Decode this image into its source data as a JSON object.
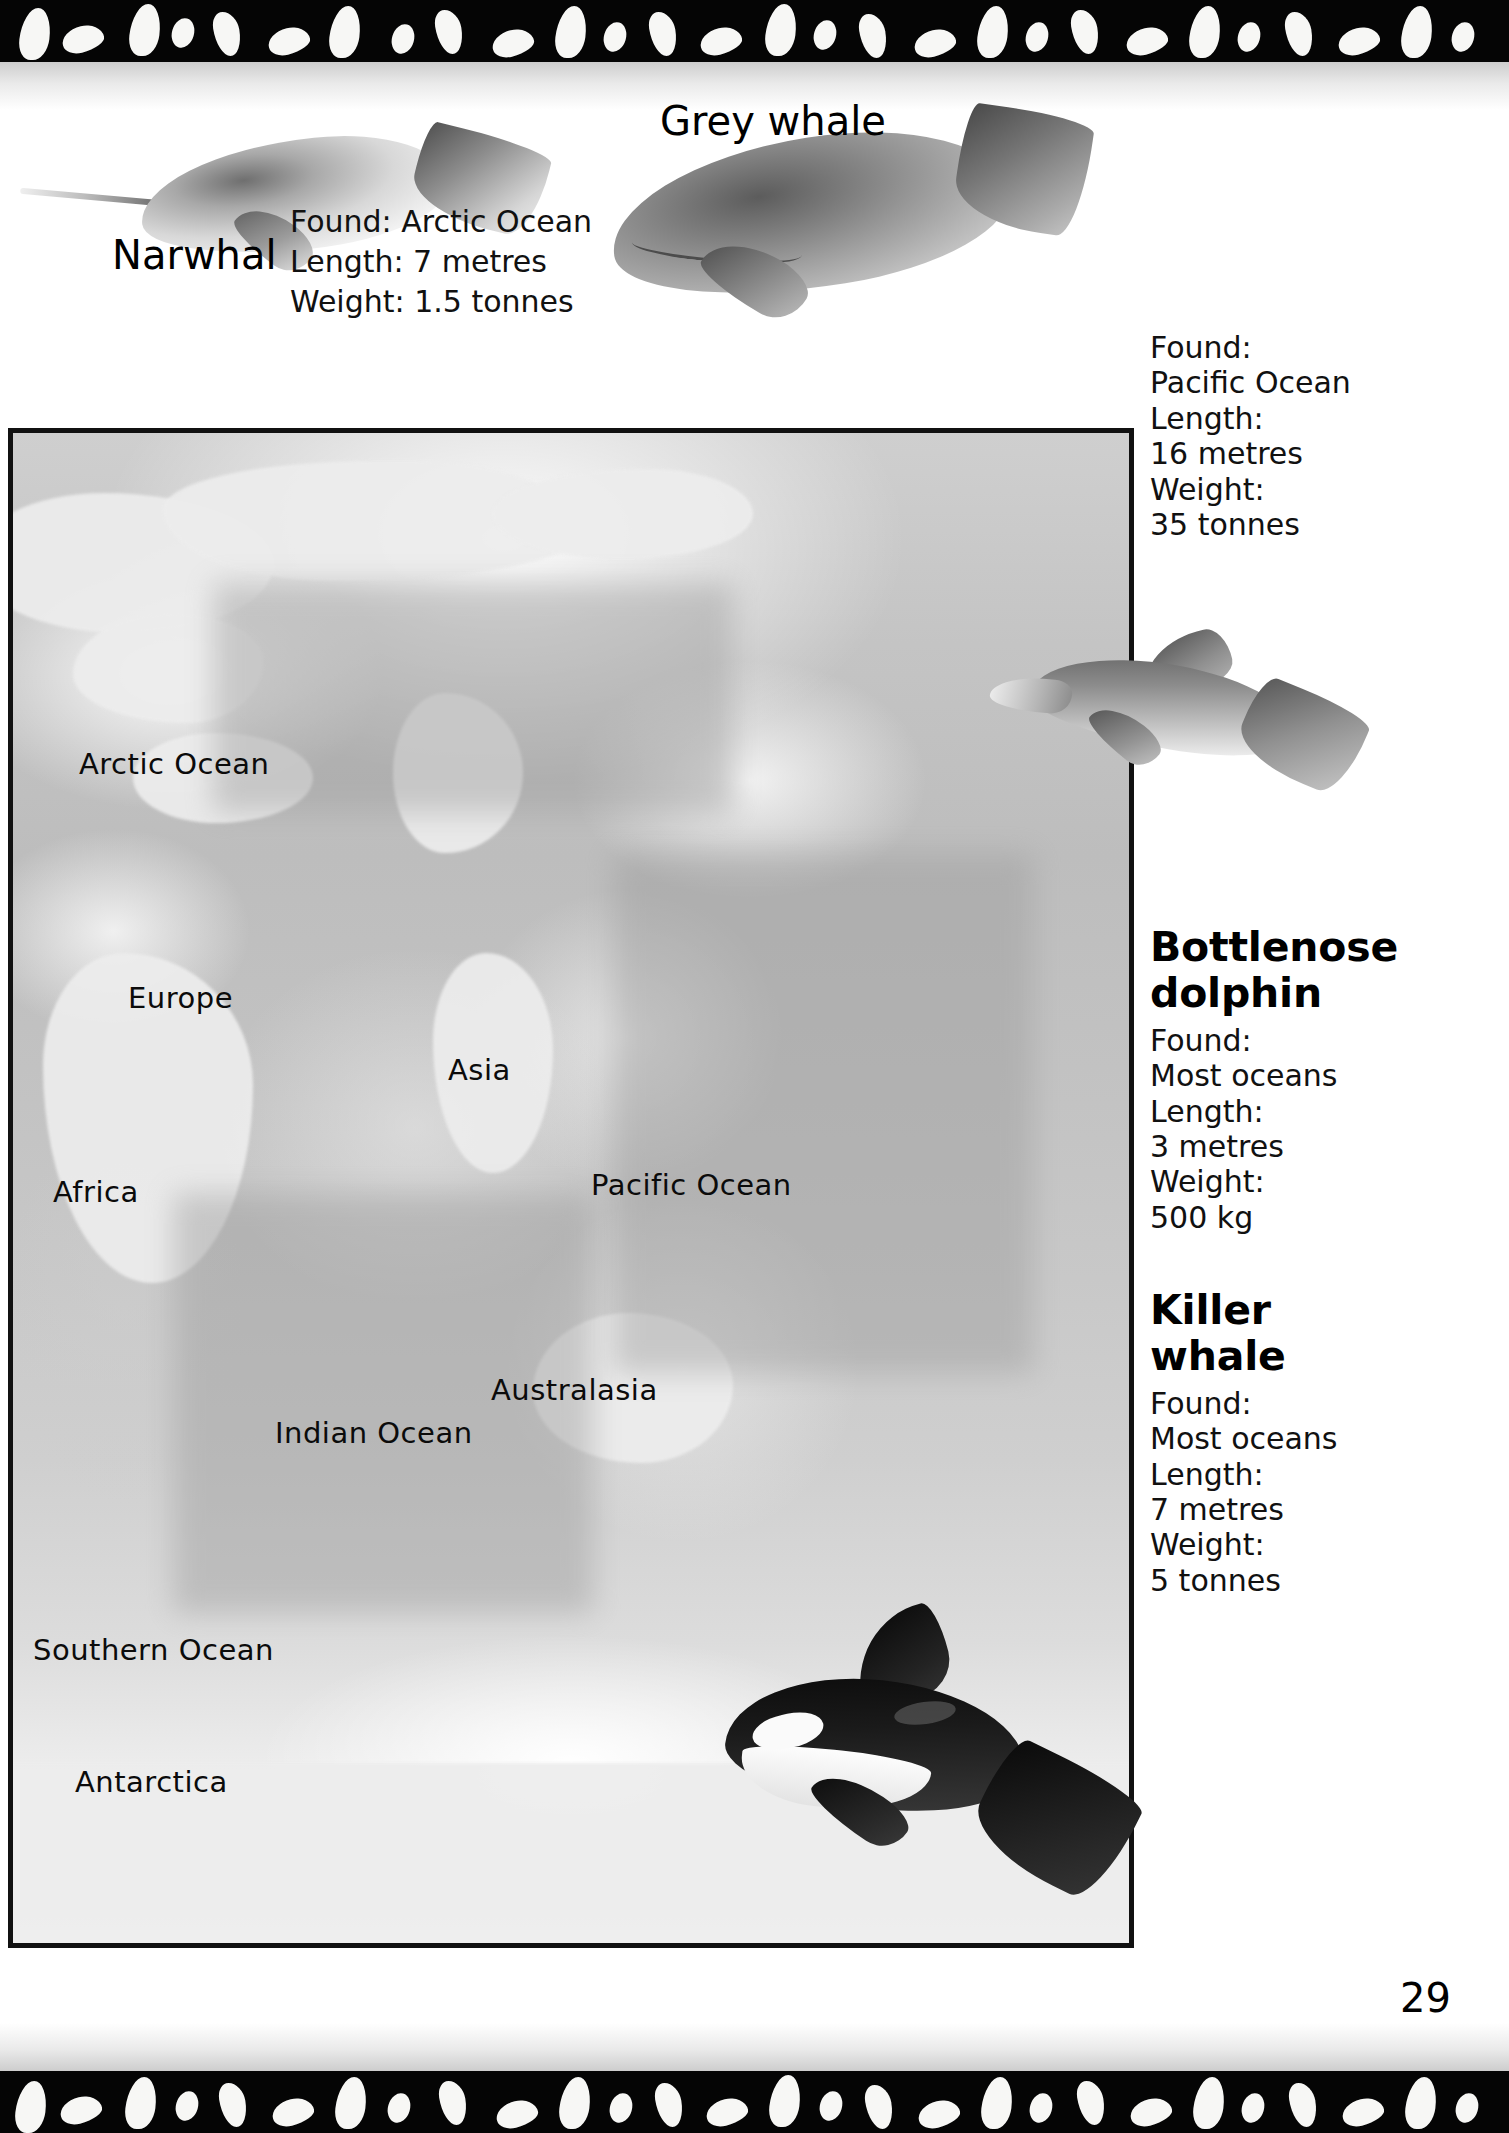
{
  "page": {
    "number": "29",
    "background_color": "#ffffff",
    "border_color": "#050505"
  },
  "specimens": [
    {
      "id": "narwhal",
      "name": "Narwhal",
      "lines": [
        "Found: Arctic Ocean",
        "Length: 7 metres",
        "Weight: 1.5 tonnes"
      ],
      "found": "Arctic Ocean",
      "length": "7 metres",
      "weight": "1.5 tonnes"
    },
    {
      "id": "grey-whale",
      "name": "Grey whale",
      "lines": [
        "Found:",
        "Pacific Ocean",
        "Length:",
        "16 metres",
        "Weight:",
        "35 tonnes"
      ],
      "found": "Pacific Ocean",
      "length": "16 metres",
      "weight": "35 tonnes"
    },
    {
      "id": "bottlenose-dolphin",
      "name_line1": "Bottlenose",
      "name_line2": "dolphin",
      "lines": [
        "Found:",
        "Most oceans",
        "Length:",
        "3 metres",
        "Weight:",
        "500 kg"
      ],
      "found": "Most oceans",
      "length": "3 metres",
      "weight": "500 kg"
    },
    {
      "id": "killer-whale",
      "name_line1": "Killer",
      "name_line2": "whale",
      "lines": [
        "Found:",
        "Most oceans",
        "Length:",
        "7 metres",
        "Weight:",
        "5 tonnes"
      ],
      "found": "Most oceans",
      "length": "7 metres",
      "weight": "5 tonnes"
    }
  ],
  "map": {
    "labels": [
      {
        "text": "Arctic Ocean",
        "x": 66,
        "y": 314
      },
      {
        "text": "Europe",
        "x": 115,
        "y": 548
      },
      {
        "text": "Asia",
        "x": 435,
        "y": 620
      },
      {
        "text": "Africa",
        "x": 40,
        "y": 742
      },
      {
        "text": "Pacific Ocean",
        "x": 578,
        "y": 735
      },
      {
        "text": "Australasia",
        "x": 478,
        "y": 940
      },
      {
        "text": "Indian Ocean",
        "x": 262,
        "y": 983
      },
      {
        "text": "Southern Ocean",
        "x": 20,
        "y": 1200
      },
      {
        "text": "Antarctica",
        "x": 62,
        "y": 1332
      }
    ]
  }
}
